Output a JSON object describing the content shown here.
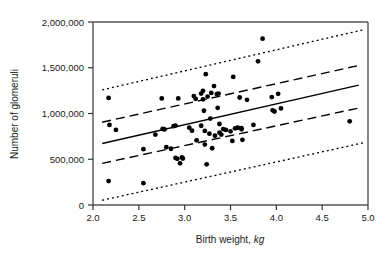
{
  "chart_data": {
    "type": "scatter",
    "title": "",
    "xlabel": "Birth weight, kg",
    "xlabel_plain": "Birth weight, ",
    "xlabel_italic": "kg",
    "ylabel": "Number of glomeruli",
    "xlim": [
      2.0,
      5.0
    ],
    "ylim": [
      0,
      2000000
    ],
    "grid": false,
    "legend": "none",
    "xticks": [
      2.0,
      2.5,
      3.0,
      3.5,
      4.0,
      4.5,
      5.0
    ],
    "xtick_labels": [
      "2.0",
      "2.5",
      "3.0",
      "3.5",
      "4.0",
      "4.5",
      "5.0"
    ],
    "yticks": [
      0,
      500000,
      1000000,
      1500000,
      2000000
    ],
    "ytick_labels": [
      "0",
      "500,000",
      "1,000,000",
      "1,500,000",
      "2,000,000"
    ],
    "marker": {
      "shape": "circle",
      "color": "#000000",
      "size": 4.6
    },
    "points": [
      [
        2.17,
        1170000
      ],
      [
        2.18,
        875000
      ],
      [
        2.17,
        262000
      ],
      [
        2.25,
        820000
      ],
      [
        2.55,
        610000
      ],
      [
        2.55,
        238000
      ],
      [
        2.68,
        770000
      ],
      [
        2.75,
        1165000
      ],
      [
        2.76,
        832000
      ],
      [
        2.78,
        826000
      ],
      [
        2.8,
        632000
      ],
      [
        2.85,
        615000
      ],
      [
        2.88,
        862000
      ],
      [
        2.9,
        868000
      ],
      [
        2.9,
        515000
      ],
      [
        2.92,
        505000
      ],
      [
        2.93,
        1165000
      ],
      [
        2.95,
        455000
      ],
      [
        2.97,
        520000
      ],
      [
        2.98,
        508000
      ],
      [
        3.05,
        845000
      ],
      [
        3.08,
        812000
      ],
      [
        3.1,
        1190000
      ],
      [
        3.12,
        1160000
      ],
      [
        3.13,
        707000
      ],
      [
        3.18,
        866000
      ],
      [
        3.18,
        1218000
      ],
      [
        3.2,
        1248000
      ],
      [
        3.2,
        1155000
      ],
      [
        3.21,
        1030000
      ],
      [
        3.22,
        810000
      ],
      [
        3.22,
        660000
      ],
      [
        3.23,
        1430000
      ],
      [
        3.24,
        445000
      ],
      [
        3.25,
        1185000
      ],
      [
        3.27,
        780000
      ],
      [
        3.28,
        945000
      ],
      [
        3.29,
        1225000
      ],
      [
        3.3,
        620000
      ],
      [
        3.32,
        1300000
      ],
      [
        3.33,
        757000
      ],
      [
        3.35,
        1212000
      ],
      [
        3.36,
        1062000
      ],
      [
        3.37,
        1218000
      ],
      [
        3.38,
        885000
      ],
      [
        3.38,
        790000
      ],
      [
        3.4,
        770000
      ],
      [
        3.42,
        830000
      ],
      [
        3.45,
        820000
      ],
      [
        3.5,
        805000
      ],
      [
        3.52,
        700000
      ],
      [
        3.53,
        1400000
      ],
      [
        3.55,
        838000
      ],
      [
        3.58,
        845000
      ],
      [
        3.6,
        1175000
      ],
      [
        3.62,
        840000
      ],
      [
        3.62,
        828000
      ],
      [
        3.63,
        712000
      ],
      [
        3.68,
        1150000
      ],
      [
        3.75,
        875000
      ],
      [
        3.8,
        1570000
      ],
      [
        3.85,
        1818000
      ],
      [
        3.95,
        1180000
      ],
      [
        3.96,
        1035000
      ],
      [
        3.98,
        1022000
      ],
      [
        4.02,
        1215000
      ],
      [
        4.05,
        1055000
      ],
      [
        4.8,
        915000
      ]
    ],
    "lines": [
      {
        "name": "regression-line",
        "style": "solid",
        "x": [
          2.1,
          4.9
        ],
        "y": [
          672000,
          1310000
        ]
      },
      {
        "name": "upper-confidence-band",
        "style": "dashed",
        "x": [
          2.1,
          4.9
        ],
        "y": [
          905000,
          1525000
        ]
      },
      {
        "name": "lower-confidence-band",
        "style": "dashed",
        "x": [
          2.1,
          4.9
        ],
        "y": [
          455000,
          1060000
        ]
      },
      {
        "name": "upper-prediction-band",
        "style": "dotted",
        "x": [
          2.1,
          4.95
        ],
        "y": [
          1258000,
          1915000
        ]
      },
      {
        "name": "lower-prediction-band",
        "style": "dotted",
        "x": [
          2.1,
          4.95
        ],
        "y": [
          52000,
          680000
        ]
      }
    ]
  },
  "axes": {
    "frame_color": "#555555",
    "tick_color": "#333333"
  }
}
